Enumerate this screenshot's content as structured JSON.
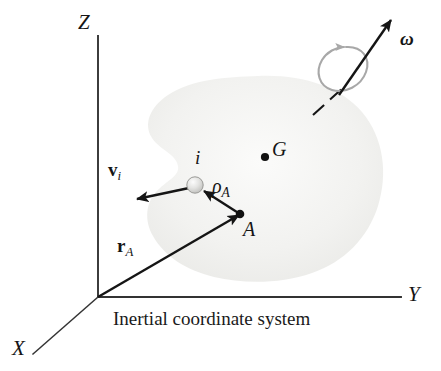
{
  "figure": {
    "caption": "Inertial coordinate system",
    "background_color": "#ffffff",
    "ink_color": "#151515",
    "body_fill_color": "#f1f1ef",
    "spin_arc_color": "#a8a8a8"
  },
  "axes": {
    "z_label": "Z",
    "y_label": "Y",
    "x_label": "X",
    "origin": {
      "x": 98,
      "y": 297
    }
  },
  "body": {
    "center_of_mass": {
      "label": "G",
      "x": 265,
      "y": 157
    },
    "reference_point": {
      "label": "A",
      "x": 240,
      "y": 215
    },
    "particle": {
      "label": "i",
      "x": 195,
      "y": 185,
      "radius": 8
    }
  },
  "vectors": [
    {
      "name": "position-vector-r-a",
      "symbol": "r",
      "subscript": "A",
      "style": "bold",
      "from": {
        "x": 98,
        "y": 297
      },
      "to": {
        "x": 240,
        "y": 215
      }
    },
    {
      "name": "relative-position-vector-rho-a",
      "symbol": "ρ",
      "subscript": "A",
      "style": "italic",
      "from": {
        "x": 240,
        "y": 215
      },
      "to": {
        "x": 203,
        "y": 191
      }
    },
    {
      "name": "velocity-vector-v-i",
      "symbol": "v",
      "subscript": "i",
      "style": "bold",
      "from": {
        "x": 188,
        "y": 188
      },
      "to": {
        "x": 136,
        "y": 199
      }
    },
    {
      "name": "angular-velocity-vector-omega",
      "symbol": "ω",
      "subscript": "",
      "style": "bold-italic",
      "from": {
        "x": 340,
        "y": 93
      },
      "to": {
        "x": 392,
        "y": 19
      }
    }
  ],
  "annotations": {
    "spin_indicator": "rotation-arc-around-omega-axis",
    "spin_axis_style": "dashed"
  }
}
